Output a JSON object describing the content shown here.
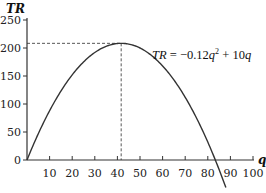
{
  "chart_data": {
    "type": "line",
    "title": "",
    "xlabel": "q",
    "ylabel": "TR",
    "xlim": [
      0,
      100
    ],
    "ylim": [
      0,
      250
    ],
    "x_ticks": [
      10,
      20,
      30,
      40,
      50,
      60,
      70,
      80,
      90,
      100
    ],
    "y_ticks": [
      0,
      50,
      100,
      150,
      200,
      250
    ],
    "grid": false,
    "series": [
      {
        "name": "TR = -0.12q^2 + 10q",
        "coefficients": {
          "a": -0.12,
          "b": 10,
          "c": 0
        },
        "x_range": [
          0,
          88
        ],
        "color": "#333333"
      }
    ],
    "annotations": [
      {
        "type": "equation",
        "text_prefix": "TR = −0.12q",
        "superscript": "2",
        "text_suffix": " + 10q"
      },
      {
        "type": "max_point_guides",
        "x": 41.67,
        "y": 208.33,
        "style": "dashed"
      }
    ],
    "origin_label": "0"
  },
  "layout": {
    "origin_px": [
      27,
      160
    ],
    "x_px_per_unit": 2.26,
    "y_px_per_unit": 0.56,
    "y_axis_top_px": 18,
    "x_axis_right_px": 254,
    "equation_pos_px": [
      152,
      59
    ]
  }
}
